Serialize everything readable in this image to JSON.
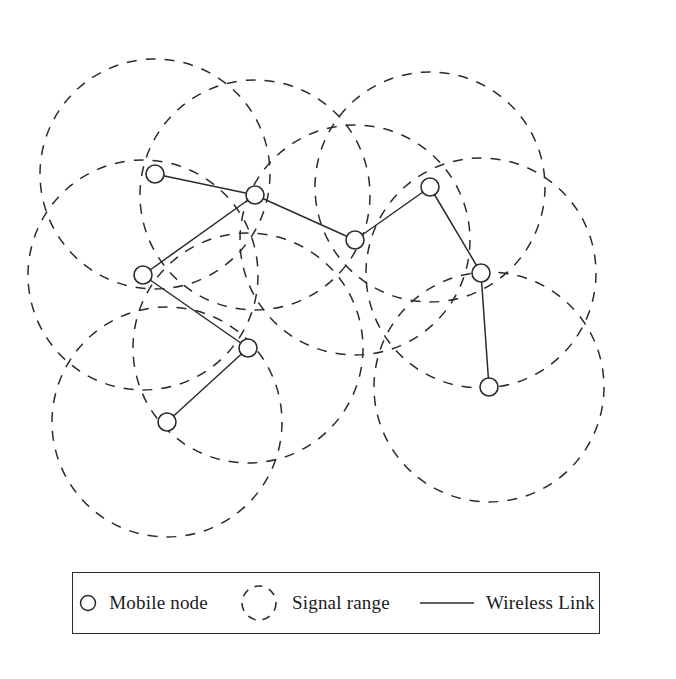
{
  "figure": {
    "type": "wireless-ad-hoc-network-topology",
    "background": "#ffffff",
    "stroke_color": "#2b2b2b",
    "node_fill": "#ffffff",
    "node_radius": 9,
    "signal_radius": 115,
    "dash_pattern": "10 9",
    "width": 676,
    "height": 679
  },
  "nodes": [
    {
      "id": "n1",
      "label": "Mobile node",
      "x": 155,
      "y": 174
    },
    {
      "id": "n2",
      "label": "Mobile node",
      "x": 255,
      "y": 195
    },
    {
      "id": "n3",
      "label": "Mobile node",
      "x": 143,
      "y": 275
    },
    {
      "id": "n4",
      "label": "Mobile node",
      "x": 248,
      "y": 348
    },
    {
      "id": "n5",
      "label": "Mobile node",
      "x": 167,
      "y": 422
    },
    {
      "id": "n6",
      "label": "Mobile node",
      "x": 355,
      "y": 240
    },
    {
      "id": "n7",
      "label": "Mobile node",
      "x": 430,
      "y": 187
    },
    {
      "id": "n8",
      "label": "Mobile node",
      "x": 481,
      "y": 273
    },
    {
      "id": "n9",
      "label": "Mobile node",
      "x": 489,
      "y": 387
    }
  ],
  "signal_ranges": [
    {
      "id": "r1",
      "cx": 155,
      "cy": 174,
      "r": 115
    },
    {
      "id": "r2",
      "cx": 255,
      "cy": 195,
      "r": 115
    },
    {
      "id": "r3",
      "cx": 143,
      "cy": 275,
      "r": 115
    },
    {
      "id": "r4",
      "cx": 248,
      "cy": 348,
      "r": 115
    },
    {
      "id": "r5",
      "cx": 167,
      "cy": 422,
      "r": 115
    },
    {
      "id": "r6",
      "cx": 355,
      "cy": 240,
      "r": 115
    },
    {
      "id": "r7",
      "cx": 430,
      "cy": 187,
      "r": 115
    },
    {
      "id": "r8",
      "cx": 481,
      "cy": 273,
      "r": 115
    },
    {
      "id": "r9",
      "cx": 489,
      "cy": 387,
      "r": 115
    }
  ],
  "links": [
    {
      "id": "l1",
      "from": "n1",
      "to": "n2"
    },
    {
      "id": "l2",
      "from": "n2",
      "to": "n3"
    },
    {
      "id": "l3",
      "from": "n2",
      "to": "n6"
    },
    {
      "id": "l4",
      "from": "n3",
      "to": "n4"
    },
    {
      "id": "l5",
      "from": "n4",
      "to": "n5"
    },
    {
      "id": "l6",
      "from": "n6",
      "to": "n7"
    },
    {
      "id": "l7",
      "from": "n7",
      "to": "n8"
    },
    {
      "id": "l8",
      "from": "n8",
      "to": "n9"
    }
  ],
  "legend": {
    "items": [
      {
        "key": "mobile_node",
        "icon": "circle-outline-icon",
        "label": "Mobile node"
      },
      {
        "key": "signal_range",
        "icon": "dashed-circle-icon",
        "label": "Signal range"
      },
      {
        "key": "wireless_link",
        "icon": "line-segment-icon",
        "label": "Wireless Link"
      }
    ]
  }
}
